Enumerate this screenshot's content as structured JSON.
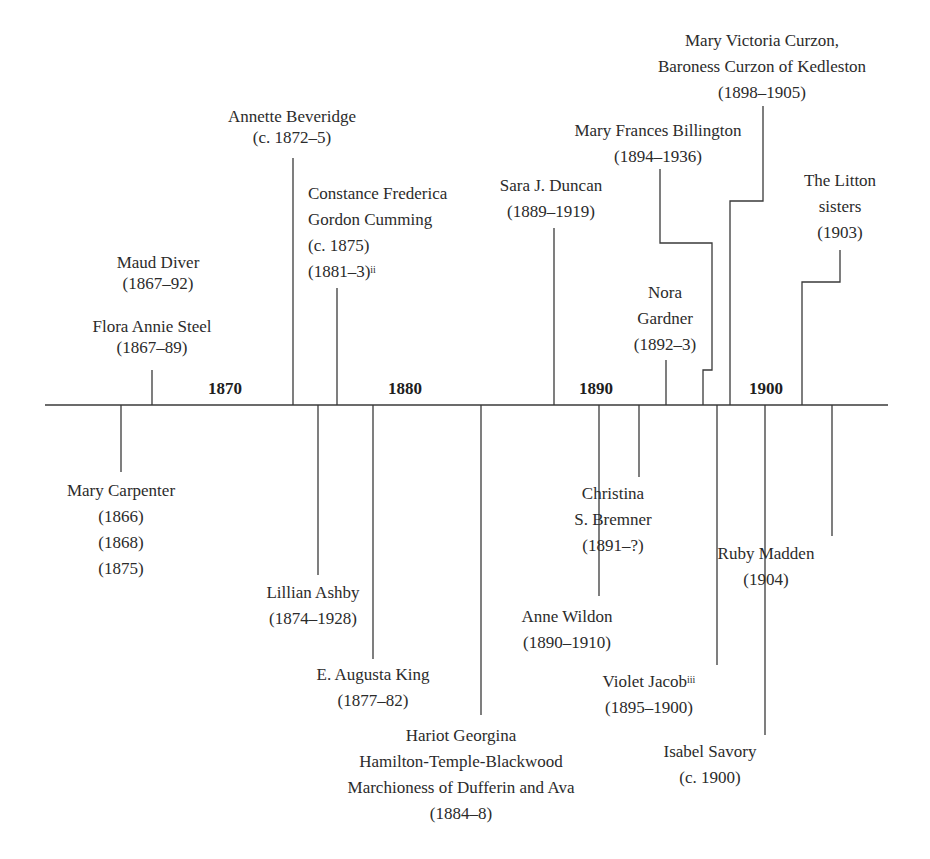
{
  "diagram": {
    "type": "timeline",
    "axis": {
      "y": 405,
      "x_start": 45,
      "x_end": 888
    },
    "decades": [
      {
        "label": "1870",
        "x": 225
      },
      {
        "label": "1880",
        "x": 405
      },
      {
        "label": "1890",
        "x": 596
      },
      {
        "label": "1900",
        "x": 766
      }
    ],
    "above": [
      {
        "name": "Maud Diver",
        "dates": "(1867–92)"
      },
      {
        "name": "Flora Annie Steel",
        "dates": "(1867–89)"
      },
      {
        "name": "Annette Beveridge",
        "dates": "(c. 1872–5)"
      },
      {
        "name_line1": "Constance Frederica",
        "name_line2": "Gordon Cumming",
        "dates1": "(c. 1875)",
        "dates2": "(1881–3)",
        "footnote": "ii"
      },
      {
        "name": "Sara J. Duncan",
        "dates": "(1889–1919)"
      },
      {
        "name_line1": "Nora",
        "name_line2": "Gardner",
        "dates": "(1892–3)"
      },
      {
        "name": "Mary Frances Billington",
        "dates": "(1894–1936)"
      },
      {
        "name_line1": "Mary Victoria Curzon,",
        "name_line2": "Baroness Curzon of Kedleston",
        "dates": "(1898–1905)"
      },
      {
        "name_line1": "The Litton",
        "name_line2": "sisters",
        "dates": "(1903)"
      }
    ],
    "below": [
      {
        "name": "Mary Carpenter",
        "dates1": "(1866)",
        "dates2": "(1868)",
        "dates3": "(1875)"
      },
      {
        "name": "Lillian Ashby",
        "dates": "(1874–1928)"
      },
      {
        "name": "E. Augusta King",
        "dates": "(1877–82)"
      },
      {
        "name_line1": "Hariot Georgina",
        "name_line2": "Hamilton-Temple-Blackwood",
        "name_line3": "Marchioness of Dufferin and Ava",
        "dates": "(1884–8)"
      },
      {
        "name": "Anne Wildon",
        "dates": "(1890–1910)"
      },
      {
        "name_line1": "Christina",
        "name_line2": "S. Bremner",
        "dates": "(1891–?)"
      },
      {
        "name": "Violet Jacob",
        "footnote": "iii",
        "dates": "(1895–1900)"
      },
      {
        "name": "Isabel Savory",
        "dates": "(c. 1900)"
      },
      {
        "name": "Ruby Madden",
        "dates": "(1904)"
      }
    ]
  }
}
